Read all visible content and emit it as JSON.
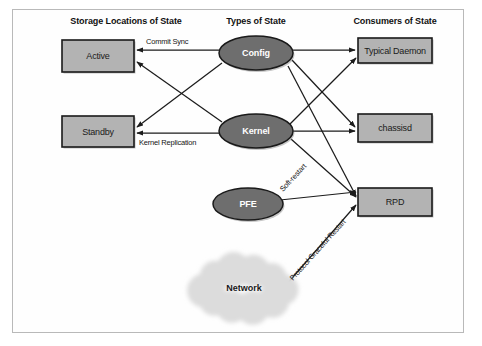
{
  "figure": {
    "background_color": "#ffffff",
    "frame_color": "#b9b9b9"
  },
  "columns": [
    {
      "id": "storage",
      "label": "Storage Locations of State",
      "x": 126,
      "y": 24
    },
    {
      "id": "types",
      "label": "Types of State",
      "x": 256,
      "y": 24
    },
    {
      "id": "consumers",
      "label": "Consumers of State",
      "x": 395,
      "y": 24
    }
  ],
  "nodes": [
    {
      "id": "active",
      "label": "Active",
      "shape": "box",
      "x": 62,
      "y": 40,
      "w": 72,
      "h": 32,
      "fill": "#b3b3b3",
      "stroke": "#1a1a1a",
      "text_color": "#1a1a1a"
    },
    {
      "id": "standby",
      "label": "Standby",
      "shape": "box",
      "x": 62,
      "y": 116,
      "w": 72,
      "h": 31,
      "fill": "#b3b3b3",
      "stroke": "#1a1a1a",
      "text_color": "#1a1a1a"
    },
    {
      "id": "config",
      "label": "Config",
      "shape": "ellipse",
      "cx": 256,
      "cy": 53,
      "rx": 37,
      "ry": 17,
      "fill": "#6e6e6e",
      "stroke": "#1a1a1a",
      "text_color": "#ffffff"
    },
    {
      "id": "kernel",
      "label": "Kernel",
      "shape": "ellipse",
      "cx": 256,
      "cy": 131,
      "rx": 37,
      "ry": 17,
      "fill": "#6e6e6e",
      "stroke": "#1a1a1a",
      "text_color": "#ffffff"
    },
    {
      "id": "pfe",
      "label": "PFE",
      "shape": "ellipse",
      "cx": 248,
      "cy": 204,
      "rx": 35,
      "ry": 16,
      "fill": "#6e6e6e",
      "stroke": "#1a1a1a",
      "text_color": "#ffffff"
    },
    {
      "id": "network",
      "label": "Network",
      "shape": "cloud",
      "cx": 244,
      "cy": 288,
      "rx": 40,
      "ry": 26,
      "fill": "#dcdcdc",
      "stroke": "none",
      "text_color": "#1a1a1a"
    },
    {
      "id": "daemon",
      "label": "Typical Daemon",
      "shape": "box",
      "x": 358,
      "y": 38,
      "w": 74,
      "h": 25,
      "fill": "#b3b3b3",
      "stroke": "#1a1a1a",
      "text_color": "#1a1a1a"
    },
    {
      "id": "chassisd",
      "label": "chassisd",
      "shape": "box",
      "x": 358,
      "y": 114,
      "w": 74,
      "h": 28,
      "fill": "#b3b3b3",
      "stroke": "#1a1a1a",
      "text_color": "#1a1a1a"
    },
    {
      "id": "rpd",
      "label": "RPD",
      "shape": "box",
      "x": 358,
      "y": 188,
      "w": 74,
      "h": 28,
      "fill": "#b3b3b3",
      "stroke": "#1a1a1a",
      "text_color": "#1a1a1a"
    }
  ],
  "edges": [
    {
      "id": "config-active",
      "from": "config",
      "to": "active",
      "x1": 219,
      "y1": 50,
      "x2": 137,
      "y2": 50,
      "arrow": "end"
    },
    {
      "id": "config-standby",
      "from": "config",
      "to": "standby",
      "x1": 222,
      "y1": 63,
      "x2": 137,
      "y2": 127,
      "arrow": "end"
    },
    {
      "id": "config-daemon",
      "from": "config",
      "to": "daemon",
      "x1": 293,
      "y1": 50,
      "x2": 355,
      "y2": 50,
      "arrow": "end"
    },
    {
      "id": "config-chassisd",
      "from": "config",
      "to": "chassisd",
      "x1": 292,
      "y1": 60,
      "x2": 355,
      "y2": 127,
      "arrow": "end"
    },
    {
      "id": "config-rpd",
      "from": "config",
      "to": "rpd",
      "x1": 288,
      "y1": 66,
      "x2": 356,
      "y2": 196,
      "arrow": "end"
    },
    {
      "id": "kernel-active",
      "from": "kernel",
      "to": "active",
      "x1": 222,
      "y1": 122,
      "x2": 137,
      "y2": 62,
      "arrow": "end"
    },
    {
      "id": "kernel-standby",
      "from": "kernel",
      "to": "standby",
      "x1": 219,
      "y1": 133,
      "x2": 137,
      "y2": 133,
      "arrow": "end"
    },
    {
      "id": "kernel-daemon",
      "from": "kernel",
      "to": "daemon",
      "x1": 290,
      "y1": 124,
      "x2": 356,
      "y2": 58,
      "arrow": "end"
    },
    {
      "id": "kernel-chassisd",
      "from": "kernel",
      "to": "chassisd",
      "x1": 293,
      "y1": 131,
      "x2": 355,
      "y2": 131,
      "arrow": "end"
    },
    {
      "id": "kernel-rpd",
      "from": "kernel",
      "to": "rpd",
      "x1": 291,
      "y1": 139,
      "x2": 356,
      "y2": 197,
      "arrow": "end"
    },
    {
      "id": "pfe-rpd",
      "from": "pfe",
      "to": "rpd",
      "x1": 280,
      "y1": 200,
      "x2": 356,
      "y2": 192,
      "arrow": "end"
    },
    {
      "id": "network-rpd",
      "from": "network",
      "to": "rpd",
      "x1": 285,
      "y1": 286,
      "x2": 356,
      "y2": 205,
      "arrow": "end"
    }
  ],
  "edge_labels": [
    {
      "id": "commit-sync",
      "text": "Commit Sync",
      "x": 146,
      "y": 44,
      "rotate": 0
    },
    {
      "id": "kernel-replication",
      "text": "Kernel Replication",
      "x": 139,
      "y": 145,
      "rotate": 0
    },
    {
      "id": "soft-restart",
      "text": "Soft-restart",
      "x": 283,
      "y": 192,
      "rotate": -47
    },
    {
      "id": "protocol-graceful-restart",
      "text": "Protocol Graceful Restart",
      "x": 293,
      "y": 281,
      "rotate": -48
    }
  ]
}
